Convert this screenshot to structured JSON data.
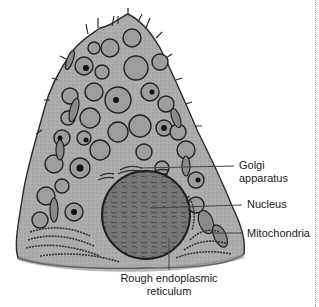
{
  "figure": {
    "colors": {
      "cytoplasm": "#a9a9a9",
      "outline": "#2b2b2b",
      "vesicle": "#9a9a9a",
      "nucleus": "#6e6e6e",
      "label_text": "#1a1a1a",
      "divider": "#9a9a9a"
    }
  },
  "labels": {
    "golgi_line1": "Golgi",
    "golgi_line2": "apparatus",
    "nucleus": "Nucleus",
    "mitochondria": "Mitochondria",
    "rer_line1": "Rough endoplasmic",
    "rer_line2": "reticulum"
  }
}
